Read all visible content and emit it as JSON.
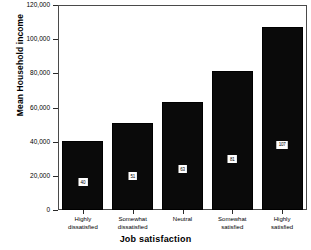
{
  "chart_data": {
    "type": "bar",
    "title": "",
    "xlabel": "Job satisfaction",
    "ylabel": "Mean Household income",
    "categories": [
      "Highly\ndissatisfied",
      "Somewhat\ndissatisfied",
      "Neutral",
      "Somewhat\nsatisfied",
      "Highly\nsatisfied"
    ],
    "values": [
      40500,
      51000,
      63000,
      81500,
      107000
    ],
    "bar_labels": [
      "40",
      "51",
      "63",
      "81",
      "107"
    ],
    "ylim": [
      0,
      120000
    ],
    "ytick_labels": [
      "0",
      "20,000",
      "40,000",
      "60,000",
      "80,000",
      "100,000",
      "120,000"
    ],
    "ytick_values": [
      0,
      20000,
      40000,
      60000,
      80000,
      100000,
      120000
    ],
    "grid": false,
    "legend": "none",
    "bar_color": "#0a0a0a",
    "frame_color": "#4a4a4a",
    "background": "#ffffff"
  }
}
